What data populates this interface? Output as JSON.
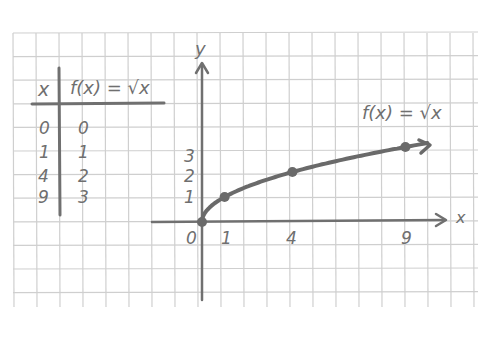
{
  "colors": {
    "paper": "#ffffff",
    "grid": "#cfcfcf",
    "ink": "#707070",
    "curve": "#6a6a6a"
  },
  "table": {
    "headers": [
      "x",
      "f(x) = √x"
    ],
    "rows": [
      {
        "x": "0",
        "fx": "0"
      },
      {
        "x": "1",
        "fx": "1"
      },
      {
        "x": "4",
        "fx": "2"
      },
      {
        "x": "9",
        "fx": "3"
      }
    ]
  },
  "chart_data": {
    "type": "line",
    "title": "",
    "function_label": "f(x) = √x",
    "xlabel": "x",
    "ylabel": "y",
    "x_ticks": [
      "0",
      "1",
      "4",
      "9"
    ],
    "y_ticks": [
      "1",
      "2",
      "3"
    ],
    "series": [
      {
        "name": "f(x) = √x",
        "points": [
          [
            0,
            0
          ],
          [
            1,
            1
          ],
          [
            4,
            2
          ],
          [
            9,
            3
          ]
        ]
      }
    ],
    "marked_points": [
      [
        0,
        0
      ],
      [
        1,
        1
      ],
      [
        4,
        2
      ],
      [
        9,
        3
      ]
    ],
    "xlim": [
      -2,
      11.5
    ],
    "ylim": [
      -3.3,
      5.5
    ],
    "grid": true,
    "legend": "none"
  }
}
